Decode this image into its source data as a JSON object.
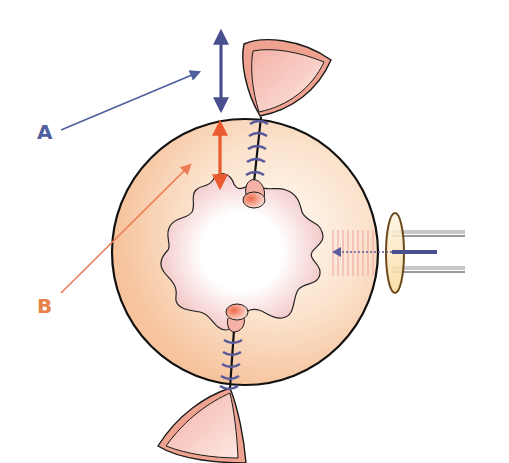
{
  "labels": {
    "a": {
      "text": "A",
      "color": "#4f5f9f"
    },
    "b": {
      "text": "B",
      "color": "#e8804a"
    }
  },
  "colors": {
    "blue_arrow": "#4a4f8f",
    "orange_arrow": "#ea5a2e",
    "orange_pointer": "#ee7a55",
    "outer_circle_fill_edge": "#f6c9a8",
    "outer_circle_fill_center": "#fff6ee",
    "inner_cavity_fill_edge": "#f2c4c4",
    "inner_cavity_fill_center": "#ffffff",
    "flap_fill": "#f2a89a",
    "flap_inner": "#fbd9d2",
    "suture": "#5a5a9c",
    "outline": "#1a1a1a",
    "probe_ring_fill": "#fbe3b8",
    "probe_ring_stroke": "#6b4a1e",
    "probe_tube": "#9a9a9a",
    "hatch": "#f0a0a0"
  },
  "elements": [
    {
      "id": "outer-circle",
      "description": "large circular outer wall"
    },
    {
      "id": "inner-cavity",
      "description": "wavy-edged inner cavity"
    },
    {
      "id": "arrow-a",
      "description": "blue double-headed vertical arrow outside wall"
    },
    {
      "id": "arrow-b",
      "description": "orange double-headed vertical arrow across wall thickness"
    },
    {
      "id": "pointer-a",
      "description": "blue pointer from label A"
    },
    {
      "id": "pointer-b",
      "description": "orange pointer from label B"
    },
    {
      "id": "top-flap",
      "description": "top cone-shaped flap"
    },
    {
      "id": "bottom-flap",
      "description": "bottom cone-shaped flap"
    },
    {
      "id": "top-suture",
      "description": "top stitched line"
    },
    {
      "id": "bottom-suture",
      "description": "bottom stitched line"
    },
    {
      "id": "probe",
      "description": "right-side probe with ring and dotted arrow"
    }
  ]
}
